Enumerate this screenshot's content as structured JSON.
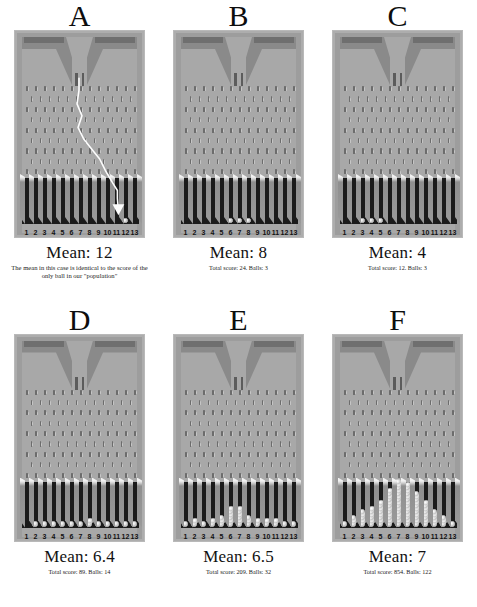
{
  "figure": {
    "title_letters": [
      "A",
      "B",
      "C",
      "D",
      "E",
      "F"
    ],
    "bin_labels": [
      "1",
      "2",
      "3",
      "4",
      "5",
      "6",
      "7",
      "8",
      "9",
      "10",
      "11",
      "12",
      "13"
    ]
  },
  "panels": [
    {
      "letter": "A",
      "mean_label": "Mean: 12",
      "caption": "The mean in this case is identical to the score of the only ball in our \"population\"",
      "balls_per_bin": [
        0,
        0,
        0,
        0,
        0,
        0,
        0,
        0,
        0,
        0,
        0,
        1,
        0
      ],
      "total_score": 12,
      "balls": 1,
      "show_path": true
    },
    {
      "letter": "B",
      "mean_label": "Mean: 8",
      "caption": "Total score: 24. Balls: 3",
      "balls_per_bin": [
        0,
        0,
        0,
        0,
        0,
        1,
        1,
        1,
        0,
        0,
        0,
        0,
        0
      ],
      "total_score": 24,
      "balls": 3,
      "show_path": false
    },
    {
      "letter": "C",
      "mean_label": "Mean: 4",
      "caption": "Total score: 12. Balls: 3",
      "balls_per_bin": [
        0,
        0,
        1,
        1,
        1,
        0,
        0,
        0,
        0,
        0,
        0,
        0,
        0
      ],
      "total_score": 12,
      "balls": 3,
      "show_path": false
    },
    {
      "letter": "D",
      "mean_label": "Mean: 6.4",
      "caption": "Total score: 89. Balls: 14",
      "balls_per_bin": [
        0,
        1,
        1,
        1,
        1,
        1,
        1,
        2,
        1,
        1,
        1,
        1,
        1
      ],
      "total_score": 89,
      "balls": 14,
      "show_path": false
    },
    {
      "letter": "E",
      "mean_label": "Mean: 6.5",
      "caption": "Total score: 209. Balls: 32",
      "balls_per_bin": [
        1,
        2,
        1,
        2,
        3,
        6,
        6,
        3,
        2,
        2,
        2,
        1,
        1
      ],
      "total_score": 209,
      "balls": 32,
      "show_path": false
    },
    {
      "letter": "F",
      "mean_label": "Mean: 7",
      "caption": "Total score: 854. Balls: 122",
      "balls_per_bin": [
        1,
        3,
        5,
        6,
        8,
        12,
        15,
        14,
        11,
        8,
        5,
        3,
        1
      ],
      "total_score": 854,
      "balls": 122,
      "show_path": false
    }
  ],
  "colors": {
    "board_background": "#a8a8a8",
    "board_frame": "#9d9d9d",
    "bin_dark": "#1b1b1b",
    "pin": "#6c6c6c",
    "hopper_bar": "#6f6f6f",
    "ball": "#f0f0f0",
    "page_background": "#ffffff"
  }
}
